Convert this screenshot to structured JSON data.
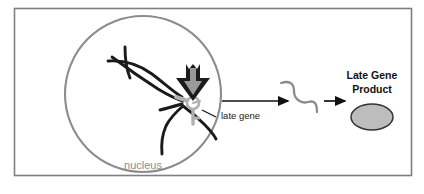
{
  "figure": {
    "type": "biology-process-diagram",
    "canvas": {
      "width": 424,
      "height": 194
    },
    "colors": {
      "frame_border": "#808080",
      "nucleus_outline": "#8c8c8c",
      "dna_strand": "#1a1a1a",
      "gene_marker": "#b0b0b0",
      "arrow_black": "#111111",
      "arrow_gray_fill": "#9a9a9a",
      "mrna": "#8c8c8c",
      "product_fill": "#bdbdbd",
      "product_stroke": "#333333",
      "background": "#ffffff",
      "nucleus_label": "#8c8c8c",
      "late_gene_label": "#1a1a1a",
      "product_label": "#111111"
    }
  },
  "frame": {
    "name": "outer-border",
    "x": 14,
    "y": 8,
    "width": 398,
    "height": 168
  },
  "nucleus": {
    "label": "nucleus",
    "cx": 143,
    "cy": 94,
    "r": 78,
    "label_x": 143,
    "label_y": 166
  },
  "gene": {
    "label": "late gene",
    "marker_cx": 193,
    "marker_cy": 103,
    "marker_r": 6,
    "label_x": 221,
    "label_y": 115,
    "leader_from": [
      202,
      110
    ],
    "leader_to": [
      216,
      117
    ]
  },
  "regulator_arrow": {
    "name": "activation-arrow",
    "description": "thick downward arrow pointing at the late gene",
    "x": 193,
    "y_top": 66,
    "y_tip": 101
  },
  "transcription_arrow": {
    "name": "transcription-arrow",
    "x_start": 222,
    "x_end": 291,
    "y": 101
  },
  "mrna": {
    "name": "mrna-squiggle",
    "description": "gray wavy line representing the late gene transcript",
    "x_start": 281,
    "x_end": 323,
    "y": 101
  },
  "translation_arrow": {
    "name": "translation-arrow",
    "x_start": 324,
    "x_end": 348,
    "y": 101
  },
  "product": {
    "label_line_1": "Late Gene",
    "label_line_2": "Product",
    "label_x": 372,
    "label_line1_y": 76,
    "label_line2_y": 89,
    "shape_cx": 372,
    "shape_cy": 117,
    "shape_rx": 21,
    "shape_ry": 13
  }
}
